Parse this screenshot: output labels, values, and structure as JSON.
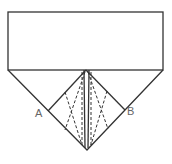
{
  "diagram": {
    "type": "origami-fold-diagram",
    "labels": {
      "point_a": "A",
      "point_b": "B"
    },
    "colors": {
      "line": "#333333",
      "label": "#666666",
      "background": "#ffffff"
    },
    "shapes": {
      "rectangle": {
        "x": 8,
        "y": 12,
        "width": 155,
        "height": 58
      },
      "outer_triangle": [
        [
          8,
          70
        ],
        [
          87,
          150
        ],
        [
          163,
          70
        ]
      ],
      "inner_kite": [
        [
          86,
          70
        ],
        [
          48,
          111
        ],
        [
          87,
          150
        ],
        [
          125,
          110
        ]
      ]
    }
  }
}
